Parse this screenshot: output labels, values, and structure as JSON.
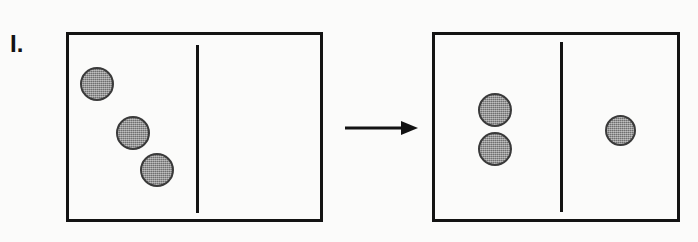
{
  "figure": {
    "label": "I.",
    "label_x": 10,
    "label_y": 32,
    "label_size": 24,
    "canvas": {
      "width": 698,
      "height": 242
    },
    "colors": {
      "background": "#fbfbfa",
      "stroke": "#131313",
      "particle_fill": "#8a8a8a",
      "particle_outline": "#3a3a3a"
    }
  },
  "panels": [
    {
      "name": "before",
      "box": {
        "x": 66,
        "y": 32,
        "width": 257,
        "height": 190
      },
      "divider": {
        "x": 196,
        "y": 45,
        "height": 168
      },
      "particles": [
        {
          "cx": 97,
          "cy": 84,
          "d": 34,
          "side": "left"
        },
        {
          "cx": 133,
          "cy": 133,
          "d": 34,
          "side": "left"
        },
        {
          "cx": 157,
          "cy": 170,
          "d": 34,
          "side": "left"
        }
      ]
    },
    {
      "name": "after",
      "box": {
        "x": 432,
        "y": 32,
        "width": 248,
        "height": 190
      },
      "divider": {
        "x": 560,
        "y": 42,
        "height": 170
      },
      "particles": [
        {
          "cx": 495,
          "cy": 110,
          "d": 34,
          "side": "left"
        },
        {
          "cx": 495,
          "cy": 149,
          "d": 34,
          "side": "left"
        },
        {
          "cx": 620,
          "cy": 130,
          "d": 31,
          "side": "right"
        }
      ]
    }
  ],
  "arrow": {
    "x1": 345,
    "y": 128,
    "x2": 418,
    "direction": "right"
  }
}
